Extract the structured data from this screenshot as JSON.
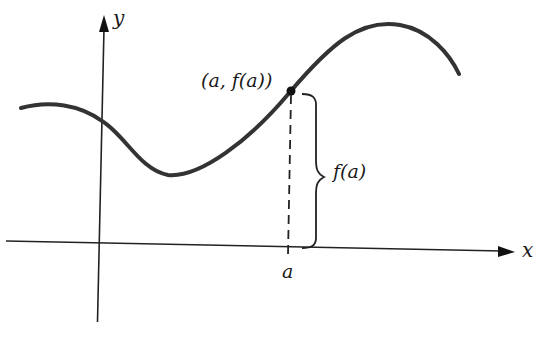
{
  "figure": {
    "labels": {
      "y_axis": "y",
      "x_axis": "x",
      "point": "(a, f(a))",
      "height": "f(a)",
      "tick": "a"
    },
    "colors": {
      "curve": "#333333",
      "axes": "#222222",
      "background": "#ffffff"
    }
  }
}
